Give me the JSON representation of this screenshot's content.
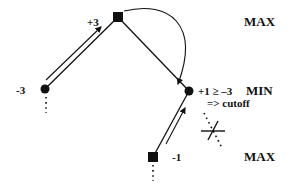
{
  "diagram": {
    "type": "game-tree-alpha-beta-cutoff",
    "levels": {
      "top": "MAX",
      "middle": "MIN",
      "bottom": "MAX"
    },
    "nodes": [
      {
        "id": "root",
        "shape": "square",
        "role": "MAX",
        "value": "+3"
      },
      {
        "id": "left",
        "shape": "circle",
        "role": "MIN",
        "value": "-3"
      },
      {
        "id": "right",
        "shape": "circle",
        "role": "MIN",
        "value": "+1 ≥ –3"
      },
      {
        "id": "leaf",
        "shape": "square",
        "role": "MAX",
        "value": "-1"
      }
    ],
    "annotations": {
      "cutoff": "=> cutoff"
    },
    "colors": {
      "ink": "#111111",
      "background": "#ffffff"
    }
  }
}
